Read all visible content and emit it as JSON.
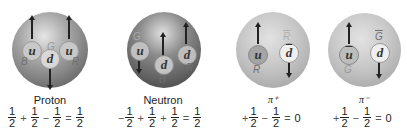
{
  "particles": [
    {
      "name": "Proton",
      "quarks": [
        {
          "flavor": "u",
          "color": "B",
          "spin": "up"
        },
        {
          "flavor": "u",
          "color": "R",
          "spin": "up"
        },
        {
          "flavor": "d",
          "color": "G",
          "spin": "down"
        }
      ],
      "equation": {
        "terms": [
          "1/2",
          "+",
          "1/2",
          "−",
          "1/2",
          "=",
          "1/2"
        ],
        "first_sign": "",
        "result": "1/2"
      }
    },
    {
      "name": "Neutron",
      "quarks": [
        {
          "flavor": "u",
          "color": "G",
          "spin": "down"
        },
        {
          "flavor": "d",
          "color": "B",
          "spin": "up"
        },
        {
          "flavor": "d",
          "color": "R",
          "spin": "up"
        }
      ],
      "equation": {
        "first_sign": "−",
        "result": "1/2"
      }
    },
    {
      "name": "π⁺",
      "quarks": [
        {
          "flavor": "u",
          "color": "R",
          "spin": "up"
        },
        {
          "flavor": "d̄",
          "color": "R̄",
          "spin": "down"
        }
      ],
      "equation": {
        "first_sign": "+",
        "result": "0"
      }
    },
    {
      "name": "π⁻",
      "quarks": [
        {
          "flavor": "ū",
          "color": "G",
          "spin": "up"
        },
        {
          "flavor": "d",
          "color": "Ḡ",
          "spin": "down"
        }
      ],
      "equation": {
        "first_sign": "+",
        "result": "0"
      }
    }
  ],
  "labels": {
    "proton": "Proton",
    "neutron": "Neutron",
    "pi_plus": "π⁺",
    "pi_minus": "π⁻"
  },
  "quark_text": {
    "u": "u",
    "d": "d",
    "u_bar": "u",
    "d_bar": "d",
    "B": "B",
    "R": "R",
    "G": "G",
    "R_bar": "R",
    "G_bar": "G"
  },
  "math": {
    "one": "1",
    "two": "2",
    "plus": "+",
    "minus": "−",
    "equals": "=",
    "zero": "0"
  }
}
